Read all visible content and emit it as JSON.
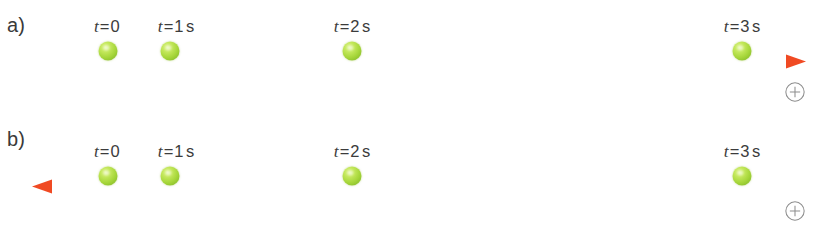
{
  "figure": {
    "width": 815,
    "height": 228,
    "background": "#ffffff"
  },
  "colors": {
    "axis_line": "#f04a23",
    "axis_line_light": "#f9a38a",
    "ball": "#a6d63a",
    "ball_highlight": "#e2f59a",
    "text": "#3c3c3c",
    "marker_stroke": "#8e8e8e"
  },
  "panels": [
    {
      "id": "a",
      "label": "a)",
      "axis": {
        "direction": "right",
        "positive_direction_label": "+",
        "arrowhead": "right",
        "line_start_x": 37,
        "line_end_x": 806,
        "line_y": 61
      },
      "positive_marker": {
        "symbol": "+",
        "x": 795,
        "y": 92
      },
      "events": [
        {
          "label_var": "t",
          "label_eq": "=",
          "label_value": "0",
          "label_unit": "",
          "x": 108,
          "label_x": 108
        },
        {
          "label_var": "t",
          "label_eq": "=",
          "label_value": "1",
          "label_unit": "s",
          "x": 170,
          "label_x": 176
        },
        {
          "label_var": "t",
          "label_eq": "=",
          "label_value": "2",
          "label_unit": "s",
          "x": 352,
          "label_x": 352
        },
        {
          "label_var": "t",
          "label_eq": "=",
          "label_value": "3",
          "label_unit": "s",
          "x": 742,
          "label_x": 742
        }
      ]
    },
    {
      "id": "b",
      "label": "b)",
      "axis": {
        "direction": "left",
        "positive_direction_label": "+",
        "arrowhead": "left",
        "line_start_x": 32,
        "line_end_x": 808,
        "line_y": 72
      },
      "positive_marker": {
        "symbol": "+",
        "x": 795,
        "y": 97
      },
      "events": [
        {
          "label_var": "t",
          "label_eq": "=",
          "label_value": "0",
          "label_unit": "",
          "x": 108,
          "label_x": 108
        },
        {
          "label_var": "t",
          "label_eq": "=",
          "label_value": "1",
          "label_unit": "s",
          "x": 170,
          "label_x": 176
        },
        {
          "label_var": "t",
          "label_eq": "=",
          "label_value": "2",
          "label_unit": "s",
          "x": 352,
          "label_x": 352
        },
        {
          "label_var": "t",
          "label_eq": "=",
          "label_value": "3",
          "label_unit": "s",
          "x": 742,
          "label_x": 742
        }
      ]
    }
  ]
}
